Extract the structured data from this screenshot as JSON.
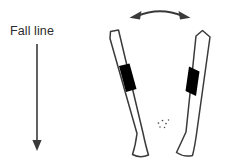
{
  "figure": {
    "background_color": "#ffffff",
    "stroke_color": "#3a3a3a",
    "fill_color": "#ffffff",
    "binding_color": "#000000",
    "text_color": "#2b2b2b",
    "width": 225,
    "height": 166
  },
  "labels": {
    "fall_line": "Fall line"
  },
  "annotations": {
    "fall_line_arrow": {
      "name": "downward-arrow",
      "direction": "down",
      "from_x": 37,
      "from_y": 44,
      "to_x": 37,
      "to_y": 150
    },
    "pivot_arrow": {
      "name": "double-headed-curved-arrow",
      "direction": "bidirectional",
      "arc_left_x": 131,
      "arc_right_x": 189,
      "arc_y": 17,
      "arc_peak_y": 8
    }
  },
  "skis": [
    {
      "name": "left-ski",
      "tail_x": 110,
      "tail_y": 32,
      "tip_x": 133,
      "tip_y": 157,
      "binding_label": "binding",
      "binding_center_x": 129,
      "binding_center_y": 82
    },
    {
      "name": "right-ski",
      "tail_x": 202,
      "tail_y": 31,
      "tip_x": 193,
      "tip_y": 156,
      "binding_label": "binding",
      "binding_center_x": 182,
      "binding_center_y": 80
    }
  ],
  "snow_spray": {
    "name": "snow-spray-speckles",
    "center_x": 163,
    "center_y": 125,
    "dot_count": 6
  }
}
